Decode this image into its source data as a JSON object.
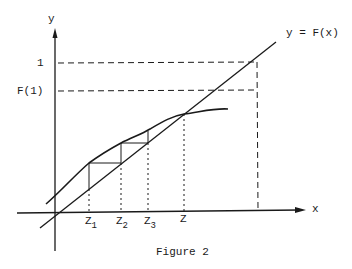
{
  "figure": {
    "caption": "Figure 2",
    "line_label": "y = F(x)",
    "axis_x_label": "x",
    "axis_y_label": "y",
    "y_tick_one": "1",
    "y_tick_f1": "F(1)",
    "x_ticks": [
      {
        "base": "Z",
        "sub": "1"
      },
      {
        "base": "Z",
        "sub": "2"
      },
      {
        "base": "Z",
        "sub": "3"
      },
      {
        "base": "Z",
        "sub": ""
      }
    ],
    "ink_color": "#1a1a1a"
  }
}
